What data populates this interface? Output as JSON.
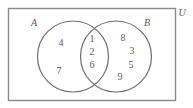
{
  "diagram": {
    "type": "venn-two-set",
    "title_visible": false,
    "universe": {
      "label": "U",
      "label_position": "outside-top-right",
      "rect": {
        "x": 8,
        "y": 8,
        "w": 167,
        "h": 92
      },
      "stroke": "#8a8a8a"
    },
    "sets": [
      {
        "id": "A",
        "label": "A",
        "label_x": 34,
        "label_y": 23,
        "circle": {
          "cx": 73,
          "cy": 56.5,
          "r": 35.5
        },
        "stroke": "#6f6f6f",
        "exclusive_members": [
          {
            "value": "4",
            "x": 61,
            "y": 43
          },
          {
            "value": "7",
            "x": 59,
            "y": 71
          }
        ]
      },
      {
        "id": "B",
        "label": "B",
        "label_x": 147,
        "label_y": 23,
        "circle": {
          "cx": 116,
          "cy": 56.5,
          "r": 35.5
        },
        "stroke": "#6f6f6f",
        "exclusive_members": [
          {
            "value": "8",
            "x": 123,
            "y": 38
          },
          {
            "value": "3",
            "x": 132,
            "y": 51
          },
          {
            "value": "5",
            "x": 131,
            "y": 65
          },
          {
            "value": "9",
            "x": 120,
            "y": 77
          }
        ]
      }
    ],
    "intersection": {
      "label": "A and B",
      "members": [
        {
          "value": "1",
          "x": 92,
          "y": 39
        },
        {
          "value": "2",
          "x": 92,
          "y": 52
        },
        {
          "value": "6",
          "x": 92,
          "y": 65
        }
      ]
    },
    "colors": {
      "universe_stroke": "#8a8a8a",
      "circle_stroke": "#6f6f6f",
      "text": "#5a5a5a",
      "background": "#ffffff"
    }
  }
}
